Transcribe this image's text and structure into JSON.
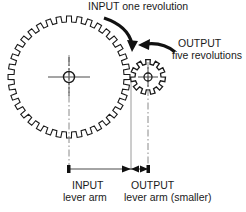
{
  "diagram": {
    "colors": {
      "stroke": "#1a1a1a",
      "centerline": "#8a8a8a",
      "background": "#ffffff"
    },
    "annotations": {
      "input_revolution": "INPUT one revolution",
      "output_revolution_line1": "OUTPUT",
      "output_revolution_line2": "five revolutions",
      "input_arm_line1": "INPUT",
      "input_arm_line2": "lever arm",
      "output_arm_line1": "OUTPUT",
      "output_arm_line2": "lever arm (smaller)"
    },
    "gears": [
      {
        "name": "input-gear",
        "role": "input",
        "cx": 69,
        "cy": 77,
        "outer_radius": 61,
        "root_radius": 55,
        "teeth": 36,
        "revolutions": 1
      },
      {
        "name": "output-gear",
        "role": "output",
        "cx": 148,
        "cy": 77,
        "outer_radius": 17.5,
        "root_radius": 13,
        "teeth": 11,
        "revolutions": 5
      }
    ],
    "dimensions": {
      "baseline_y": 169,
      "input_arm_start_x": 69,
      "input_arm_end_x": 131,
      "output_arm_start_x": 131,
      "output_arm_end_x": 148
    }
  }
}
